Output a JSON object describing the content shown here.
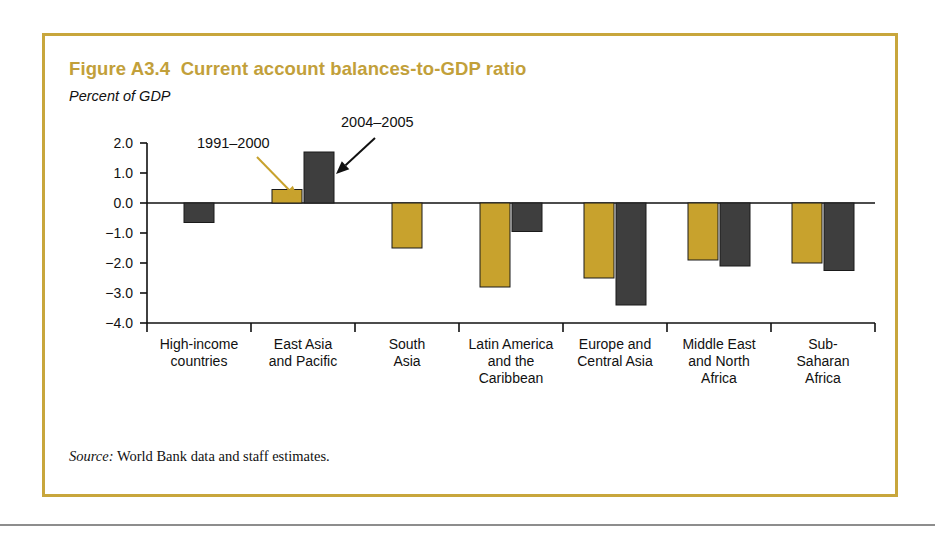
{
  "figure": {
    "title": "Figure A3.4  Current account balances-to-GDP ratio",
    "unit_label": "Percent of GDP",
    "source_prefix": "Source:",
    "source_text": " World Bank data and staff estimates.",
    "border_color": "#c8a63c",
    "title_color": "#c2a03a"
  },
  "chart_data": {
    "type": "bar",
    "title": "Figure A3.4  Current account balances-to-GDP ratio",
    "xlabel": "",
    "ylabel": "Percent of GDP",
    "ylim": [
      -4.0,
      2.0
    ],
    "yticks": [
      "2.0",
      "1.0",
      "0.0",
      "-1.0",
      "-2.0",
      "-3.0",
      "-4.0"
    ],
    "ytick_values": [
      2.0,
      1.0,
      0.0,
      -1.0,
      -2.0,
      -3.0,
      -4.0
    ],
    "grid": false,
    "legend": "annotations",
    "categories": [
      "High-income countries",
      "East Asia and Pacific",
      "South Asia",
      "Latin America and the Caribbean",
      "Europe and Central Asia",
      "Middle East and North Africa",
      "Sub-Saharan Africa"
    ],
    "category_lines": [
      [
        "High-income",
        "countries"
      ],
      [
        "East Asia",
        "and Pacific"
      ],
      [
        "South",
        "Asia"
      ],
      [
        "Latin America",
        "and the",
        "Caribbean"
      ],
      [
        "Europe and",
        "Central Asia"
      ],
      [
        "Middle East",
        "and North",
        "Africa"
      ],
      [
        "Sub-",
        "Saharan",
        "Africa"
      ]
    ],
    "series": [
      {
        "name": "1991-2000",
        "color": "#c8a22d",
        "values": [
          null,
          0.45,
          -1.5,
          -2.8,
          -2.5,
          -1.9,
          -2.0
        ]
      },
      {
        "name": "2004-2005",
        "color": "#3e3e3e",
        "values": [
          -0.65,
          1.7,
          null,
          -0.95,
          -3.4,
          -2.1,
          -2.25
        ]
      }
    ],
    "annotations": [
      {
        "text": "1991–2000",
        "series": "1991-2000",
        "color": "#c8a22d"
      },
      {
        "text": "2004–2005",
        "series": "2004-2005",
        "color": "#111111"
      }
    ]
  }
}
